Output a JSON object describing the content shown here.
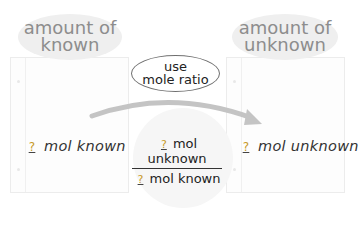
{
  "diagram": {
    "left_header": {
      "line1": "amount of",
      "line2": "known"
    },
    "right_header": {
      "line1": "amount of",
      "line2": "unknown"
    },
    "conversion_label": {
      "line1": "use",
      "line2": "mole ratio"
    },
    "left_quantity": {
      "placeholder": "?",
      "text": "mol known"
    },
    "right_quantity": {
      "placeholder": "?",
      "text": "mol unknown"
    },
    "mole_ratio": {
      "numerator": {
        "placeholder": "?",
        "text": "mol unknown"
      },
      "denominator": {
        "placeholder": "?",
        "text": "mol known"
      }
    },
    "arrow": {
      "from": "amount of known",
      "to": "amount of unknown"
    },
    "colors": {
      "placeholder": "#c89a2a",
      "header_text": "#8d8d8d",
      "arrow": "#c4c4c4"
    }
  }
}
